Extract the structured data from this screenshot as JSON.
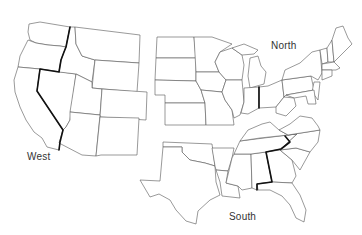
{
  "map": {
    "title": "",
    "regions": [
      {
        "name": "West",
        "label": "West",
        "label_pos": [
          27,
          152
        ]
      },
      {
        "name": "North",
        "label": "North",
        "label_pos": [
          271,
          41
        ]
      },
      {
        "name": "South",
        "label": "South",
        "label_pos": [
          229,
          212
        ]
      }
    ],
    "colors": {
      "state_fill": "#ffffff",
      "state_stroke": "#555555",
      "bold_border": "#111111",
      "background": "#ffffff"
    }
  }
}
